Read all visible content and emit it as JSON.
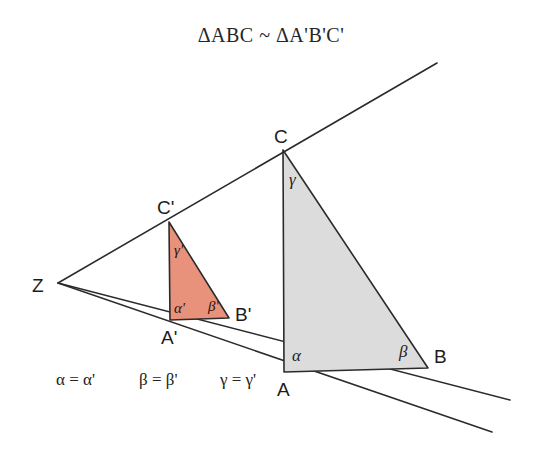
{
  "figure": {
    "title": "ΔABC ~ ΔA'B'C'",
    "background_color": "#ffffff",
    "line_color": "#2b2b2b",
    "large_triangle": {
      "name": "ABC",
      "fill_color": "#DCDCDC",
      "vertices": {
        "A": {
          "label": "A",
          "x": 284,
          "y": 372,
          "label_x": 277,
          "label_y": 396
        },
        "B": {
          "label": "B",
          "x": 428,
          "y": 368,
          "label_x": 434,
          "label_y": 363
        },
        "C": {
          "label": "C",
          "x": 283,
          "y": 150,
          "label_x": 274,
          "label_y": 143
        }
      },
      "angles": {
        "alpha": {
          "label": "α",
          "x": 292,
          "y": 361
        },
        "beta": {
          "label": "β",
          "x": 399,
          "y": 357
        },
        "gamma": {
          "label": "γ",
          "x": 289,
          "y": 185
        }
      }
    },
    "small_triangle": {
      "name": "A'B'C'",
      "fill_color": "#E8927C",
      "vertices": {
        "A_prime": {
          "label": "A'",
          "x": 170,
          "y": 320,
          "label_x": 161,
          "label_y": 344
        },
        "B_prime": {
          "label": "B'",
          "x": 229,
          "y": 318,
          "label_x": 235,
          "label_y": 321
        },
        "C_prime": {
          "label": "C'",
          "x": 169,
          "y": 222,
          "label_x": 157,
          "label_y": 214
        }
      },
      "angles": {
        "alpha_prime": {
          "label": "α'",
          "x": 174,
          "y": 313
        },
        "beta_prime": {
          "label": "β'",
          "x": 208,
          "y": 311
        },
        "gamma_prime": {
          "label": "γ'",
          "x": 174,
          "y": 255
        }
      }
    },
    "center_point": {
      "label": "Z",
      "x": 58,
      "y": 283,
      "label_x": 32,
      "label_y": 292
    },
    "rays": [
      {
        "name": "ray-through-C",
        "x1": 58,
        "y1": 283,
        "x2": 437,
        "y2": 63
      },
      {
        "name": "ray-through-B",
        "x1": 58,
        "y1": 283,
        "x2": 510,
        "y2": 400
      },
      {
        "name": "ray-through-A",
        "x1": 58,
        "y1": 283,
        "x2": 492,
        "y2": 432
      }
    ],
    "equations": [
      {
        "name": "alpha-equality",
        "text": "α = α'",
        "x": 56,
        "y": 385
      },
      {
        "name": "beta-equality",
        "text": "β = β'",
        "x": 139,
        "y": 385
      },
      {
        "name": "gamma-equality",
        "text": "γ = γ'",
        "x": 220,
        "y": 385
      }
    ],
    "title_position": {
      "x": 271,
      "y": 42
    }
  }
}
